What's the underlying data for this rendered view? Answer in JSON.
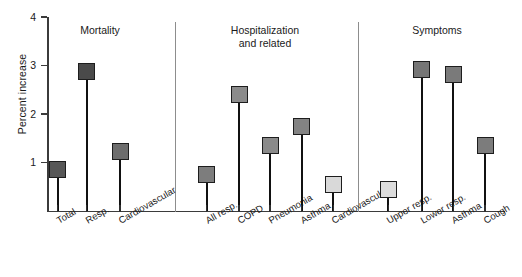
{
  "chart_data": {
    "type": "bar",
    "title": "",
    "xlabel": "",
    "ylabel": "Percent increase",
    "ylim": [
      0,
      4
    ],
    "yticks": [
      1,
      2,
      3,
      4
    ],
    "ytick_labels": [
      "1",
      "2",
      "3",
      "4"
    ],
    "grid": false,
    "legend": "none",
    "note": "Lollipop / stem-and-marker chart grouped into three panels separated by vertical rules",
    "groups": [
      {
        "name": "Mortality",
        "categories": [
          "Total",
          "Resp.",
          "Cardiovascular"
        ],
        "values": [
          0.85,
          2.88,
          1.22
        ],
        "marker_colors": [
          "#575757",
          "#4a4a4a",
          "#6d6d6d"
        ]
      },
      {
        "name": "Hospitalization\nand related",
        "title_lines": [
          "Hospitalization",
          "and related"
        ],
        "categories": [
          "All resp.",
          "COPD",
          "Pneumonia",
          "Asthma",
          "Cardiovascular"
        ],
        "values": [
          0.76,
          2.4,
          1.35,
          1.74,
          0.55
        ],
        "marker_colors": [
          "#7d7d7d",
          "#8b8b8b",
          "#8a8a8a",
          "#838383",
          "#d9d9d9"
        ]
      },
      {
        "name": "Symptoms",
        "categories": [
          "Upper resp.",
          "Lower resp.",
          "Asthma",
          "Cough"
        ],
        "values": [
          0.44,
          2.92,
          2.82,
          1.36
        ],
        "marker_colors": [
          "#dcdcdc",
          "#767676",
          "#7a7a7a",
          "#7c7c7c"
        ]
      }
    ],
    "colors": {
      "axis": "#3b3b3b",
      "stem": "#111111",
      "divider": "#8d8d8d",
      "marker_edge": "#1d1d1d",
      "background": "#ffffff"
    }
  }
}
